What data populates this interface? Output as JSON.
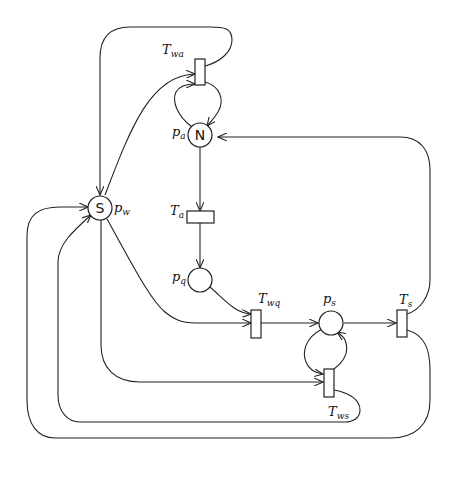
{
  "diagram": {
    "type": "petri-net",
    "places": [
      {
        "id": "p_w",
        "label_main": "p",
        "label_sub": "w",
        "token": "S"
      },
      {
        "id": "p_a",
        "label_main": "p",
        "label_sub": "a",
        "token": "N"
      },
      {
        "id": "p_q",
        "label_main": "p",
        "label_sub": "q",
        "token": ""
      },
      {
        "id": "p_s",
        "label_main": "p",
        "label_sub": "s",
        "token": ""
      }
    ],
    "transitions": [
      {
        "id": "T_wa",
        "label_main": "T",
        "label_sub": "wa"
      },
      {
        "id": "T_a",
        "label_main": "T",
        "label_sub": "a"
      },
      {
        "id": "T_wq",
        "label_main": "T",
        "label_sub": "wq"
      },
      {
        "id": "T_s",
        "label_main": "T",
        "label_sub": "s"
      },
      {
        "id": "T_ws",
        "label_main": "T",
        "label_sub": "ws"
      }
    ],
    "arcs": [
      [
        "p_w",
        "T_wa"
      ],
      [
        "T_wa",
        "p_w"
      ],
      [
        "p_a",
        "T_wa"
      ],
      [
        "T_wa",
        "p_a"
      ],
      [
        "p_a",
        "T_a"
      ],
      [
        "T_a",
        "p_q"
      ],
      [
        "p_q",
        "T_wq"
      ],
      [
        "p_w",
        "T_wq"
      ],
      [
        "T_wq",
        "p_s"
      ],
      [
        "p_s",
        "T_s"
      ],
      [
        "T_s",
        "p_a"
      ],
      [
        "T_s",
        "p_w"
      ],
      [
        "p_s",
        "T_ws"
      ],
      [
        "T_ws",
        "p_s"
      ],
      [
        "p_w",
        "T_ws"
      ],
      [
        "T_ws",
        "p_w"
      ]
    ]
  }
}
